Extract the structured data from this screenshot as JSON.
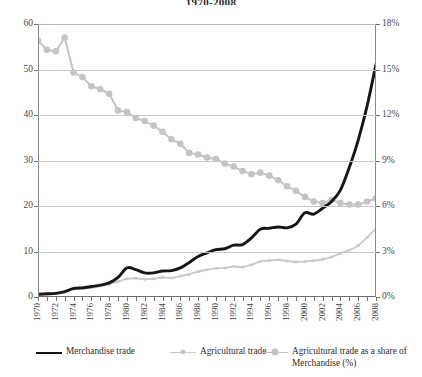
{
  "title": "1970-2008",
  "colors": {
    "merchandise": "#161616",
    "agricultural": "#c9c9c9",
    "share": "#c4c4c4",
    "axis": "#6f6f6f",
    "grid": "#c9c9c9",
    "text": "#3a3a3a"
  },
  "legend": [
    {
      "label": "Merchandise trade",
      "marker": "line",
      "color": "#161616",
      "name": "legend-item-merchandise-trade"
    },
    {
      "label": "Agricultural trade",
      "marker": "line-dot-small",
      "color": "#c9c9c9",
      "name": "legend-item-agricultural-trade"
    },
    {
      "label": "Agricultural trade as a share of Merchandise (%)",
      "marker": "line-dot",
      "color": "#c4c4c4",
      "name": "legend-item-agricultural-share"
    }
  ],
  "axes": {
    "left": {
      "min": 0,
      "max": 60,
      "ticks": [
        0,
        10,
        20,
        30,
        40,
        50,
        60
      ],
      "tick_labels": [
        "0",
        "10",
        "20",
        "30",
        "40",
        "50",
        "60"
      ]
    },
    "right": {
      "min": 0,
      "max": 18,
      "ticks": [
        0,
        3,
        6,
        9,
        12,
        15,
        18
      ],
      "tick_labels": [
        "0%",
        "3%",
        "6%",
        "9%",
        "12%",
        "15%",
        "18%"
      ]
    },
    "x": {
      "min": 1970,
      "max": 2008,
      "label_step": 2,
      "tick_labels": [
        "1970",
        "1972",
        "1974",
        "1976",
        "1978",
        "1980",
        "1982",
        "1984",
        "1986",
        "1988",
        "1990",
        "1992",
        "1994",
        "1996",
        "1998",
        "2000",
        "2002",
        "2004",
        "2006",
        "2008"
      ]
    }
  },
  "chart_data": {
    "type": "line",
    "title": "1970-2008",
    "xlabel": "",
    "ylabel": "",
    "y2label": "",
    "xlim": [
      1970,
      2008
    ],
    "ylim": [
      0,
      60
    ],
    "y2lim": [
      0,
      18
    ],
    "grid": true,
    "legend_position": "bottom",
    "x": [
      1970,
      1971,
      1972,
      1973,
      1974,
      1975,
      1976,
      1977,
      1978,
      1979,
      1980,
      1981,
      1982,
      1983,
      1984,
      1985,
      1986,
      1987,
      1988,
      1989,
      1990,
      1991,
      1992,
      1993,
      1994,
      1995,
      1996,
      1997,
      1998,
      1999,
      2000,
      2001,
      2002,
      2003,
      2004,
      2005,
      2006,
      2007,
      2008
    ],
    "series": [
      {
        "name": "Merchandise trade",
        "axis": "left",
        "units": "index",
        "color": "#161616",
        "values": [
          0.6,
          0.7,
          0.8,
          1.2,
          1.9,
          2.0,
          2.3,
          2.6,
          3.1,
          4.3,
          6.4,
          6.0,
          5.3,
          5.3,
          5.7,
          5.8,
          6.4,
          7.6,
          8.9,
          9.7,
          10.4,
          10.6,
          11.4,
          11.5,
          13.0,
          14.9,
          15.1,
          15.4,
          15.2,
          16.0,
          18.5,
          18.2,
          19.5,
          21.0,
          23.5,
          28.5,
          34.5,
          42.0,
          51.2
        ]
      },
      {
        "name": "Agricultural trade",
        "axis": "left",
        "units": "index",
        "color": "#c9c9c9",
        "values": [
          0.5,
          0.6,
          0.7,
          1.1,
          1.7,
          1.8,
          2.0,
          2.4,
          2.8,
          3.4,
          4.0,
          4.1,
          3.9,
          4.0,
          4.3,
          4.2,
          4.6,
          5.0,
          5.6,
          6.0,
          6.3,
          6.4,
          6.7,
          6.6,
          7.1,
          7.8,
          8.0,
          8.2,
          7.9,
          7.7,
          7.8,
          8.0,
          8.3,
          8.8,
          9.6,
          10.3,
          11.3,
          13.1,
          15.0
        ]
      },
      {
        "name": "Agricultural trade as a share of Merchandise (%)",
        "axis": "right",
        "units": "percent",
        "color": "#c4c4c4",
        "values": [
          16.9,
          16.3,
          16.2,
          17.1,
          14.8,
          14.5,
          13.9,
          13.7,
          13.4,
          12.3,
          12.2,
          11.8,
          11.6,
          11.3,
          10.9,
          10.4,
          10.1,
          9.5,
          9.4,
          9.2,
          9.1,
          8.8,
          8.6,
          8.3,
          8.1,
          8.2,
          8.0,
          7.7,
          7.3,
          7.0,
          6.6,
          6.3,
          6.2,
          6.4,
          6.2,
          6.1,
          6.1,
          6.3,
          6.5
        ]
      }
    ]
  }
}
